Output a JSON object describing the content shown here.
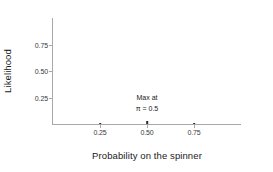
{
  "chart_data": {
    "type": "scatter",
    "title": "",
    "xlabel": "Probability on the spinner",
    "ylabel": "Likelihood",
    "xlim": [
      0.0,
      1.0
    ],
    "ylim": [
      0.0,
      1.0
    ],
    "grid": false,
    "legend": null,
    "xticks": [
      0.25,
      0.5,
      0.75
    ],
    "xticklabels": [
      "0.25",
      "0.50",
      "0.75"
    ],
    "yticks": [
      0.25,
      0.5,
      0.75
    ],
    "yticklabels": [
      "0.25",
      "0.50",
      "0.75"
    ],
    "x": [
      0.25,
      0.5,
      0.75
    ],
    "values": [
      0.012,
      0.03,
      0.012
    ],
    "points": [
      {
        "x": 0.25,
        "y": 0.012,
        "xlabel": "0.25"
      },
      {
        "x": 0.5,
        "y": 0.03,
        "xlabel": "0.50"
      },
      {
        "x": 0.75,
        "y": 0.012,
        "xlabel": "0.75"
      }
    ],
    "annotations": [
      {
        "x": 0.5,
        "y": 0.22,
        "lines": [
          "Max at",
          "π = 0.5"
        ]
      }
    ],
    "colors": {
      "background": "#ffffff",
      "axis": "#a8a8a8",
      "tick_label": "#3a3a3a",
      "axis_title": "#1a1a1a",
      "marker": "#2b2b2b",
      "annotation": "#1a1a1a"
    }
  }
}
